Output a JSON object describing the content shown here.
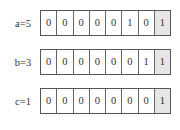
{
  "diagram": {
    "type": "bit-register-array",
    "highlight_color": "#e6e6e6",
    "rows": [
      {
        "label": "a=5",
        "bits": [
          "0",
          "0",
          "0",
          "0",
          "0",
          "1",
          "0",
          "1"
        ],
        "highlighted_index": 7
      },
      {
        "label": "b=3",
        "bits": [
          "0",
          "0",
          "0",
          "0",
          "0",
          "0",
          "1",
          "1"
        ],
        "highlighted_index": 7
      },
      {
        "label": "c=1",
        "bits": [
          "0",
          "0",
          "0",
          "0",
          "0",
          "0",
          "0",
          "1"
        ],
        "highlighted_index": 7
      }
    ]
  }
}
